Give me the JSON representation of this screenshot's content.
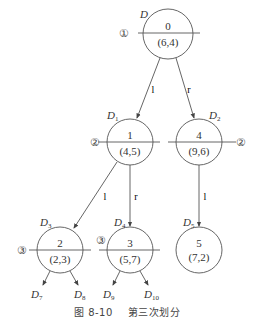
{
  "figure": {
    "caption_number": "图 8-10",
    "caption_text": "第三次划分"
  },
  "nodes": [
    {
      "id": "0",
      "point": "(6,4)",
      "set": "D",
      "set_sub": "",
      "step": "①"
    },
    {
      "id": "1",
      "point": "(4,5)",
      "set": "D",
      "set_sub": "1",
      "step": "②"
    },
    {
      "id": "4",
      "point": "(9,6)",
      "set": "D",
      "set_sub": "2",
      "step": "②"
    },
    {
      "id": "2",
      "point": "(2,3)",
      "set": "D",
      "set_sub": "3",
      "step": "③"
    },
    {
      "id": "3",
      "point": "(5,7)",
      "set": "D",
      "set_sub": "4",
      "step": "③"
    },
    {
      "id": "5",
      "point": "(7,2)",
      "set": "D",
      "set_sub": "5",
      "step": ""
    }
  ],
  "edges": [
    {
      "from": "0",
      "to": "1",
      "label": "l"
    },
    {
      "from": "0",
      "to": "4",
      "label": "r"
    },
    {
      "from": "1",
      "to": "2",
      "label": "l"
    },
    {
      "from": "1",
      "to": "3",
      "label": "r"
    },
    {
      "from": "4",
      "to": "5",
      "label": "l"
    }
  ],
  "leaf_sets": [
    {
      "set": "D",
      "sub": "7"
    },
    {
      "set": "D",
      "sub": "8"
    },
    {
      "set": "D",
      "sub": "9"
    },
    {
      "set": "D",
      "sub": "10"
    }
  ]
}
